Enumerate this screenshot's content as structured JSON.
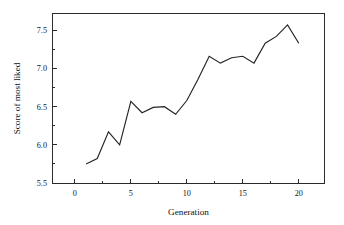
{
  "chart_data": {
    "type": "line",
    "title": "",
    "xlabel": "Generation",
    "ylabel": "Score of most liked",
    "xlim": [
      -2.0,
      22.3
    ],
    "ylim": [
      5.5,
      7.72
    ],
    "grid": false,
    "legend": null,
    "x_major_ticks": [
      0,
      5,
      10,
      15,
      20
    ],
    "x_major_tick_labels": [
      "0",
      "5",
      "10",
      "15",
      "20"
    ],
    "x_minor_ticks": [
      2.5,
      7.5,
      12.5,
      17.5
    ],
    "y_major_ticks": [
      5.5,
      6.0,
      6.5,
      7.0,
      7.5
    ],
    "y_major_tick_labels": [
      "5.5",
      "6.0",
      "6.5",
      "7.0",
      "7.5"
    ],
    "y_minor_ticks": [
      5.75,
      6.25,
      6.75,
      7.25
    ],
    "x": [
      1,
      2,
      3,
      4,
      5,
      6,
      7,
      8,
      9,
      10,
      11,
      12,
      13,
      14,
      15,
      16,
      17,
      18,
      19,
      20
    ],
    "values": [
      5.75,
      5.82,
      6.17,
      6.0,
      6.57,
      6.42,
      6.49,
      6.5,
      6.4,
      6.58,
      6.86,
      7.16,
      7.07,
      7.14,
      7.16,
      7.07,
      7.33,
      7.42,
      7.57,
      7.33
    ],
    "series": [
      {
        "name": "Score of most liked",
        "color": "#242424",
        "values": [
          5.75,
          5.82,
          6.17,
          6.0,
          6.57,
          6.42,
          6.49,
          6.5,
          6.4,
          6.58,
          6.86,
          7.16,
          7.07,
          7.14,
          7.16,
          7.07,
          7.33,
          7.42,
          7.57,
          7.33
        ]
      }
    ]
  },
  "axes": {
    "x_title": "Generation",
    "y_title": "Score of most liked",
    "x_tick_labels": [
      "0",
      "5",
      "10",
      "15",
      "20"
    ],
    "y_tick_labels": [
      "5.5",
      "6.0",
      "6.5",
      "7.0",
      "7.5"
    ]
  },
  "colors": {
    "line": "#242424",
    "frame": "#2b2b2b",
    "background": "#ffffff",
    "text": "#141414"
  }
}
